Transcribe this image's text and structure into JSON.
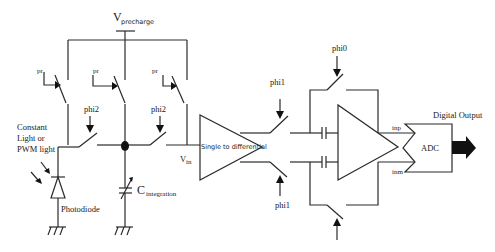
{
  "diagram": {
    "supply": {
      "main": "V",
      "sub": "precharge"
    },
    "switch_labels": {
      "pr1": "pr",
      "pr2": "pr",
      "pr3": "pr",
      "phi2_a": "phi2",
      "phi2_b": "phi2",
      "phi1_top": "phi1",
      "phi1_bot": "phi1",
      "phi0": "phi0"
    },
    "light_source": {
      "line1": "Constant",
      "line2": "Light or",
      "line3": "PWM light"
    },
    "photodiode": "Photodiode",
    "capacitor": {
      "main": "C",
      "sub": "integration"
    },
    "vin": {
      "main": "V",
      "sub": "in"
    },
    "converter": "Single to differential",
    "amp_outputs": {
      "positive": "inp",
      "negative": "inm"
    },
    "adc": "ADC",
    "output": "Digital Output",
    "colors": {
      "wire": "#2a2a2a",
      "background": "#ffffff",
      "arrow_fill": "#111111"
    }
  }
}
